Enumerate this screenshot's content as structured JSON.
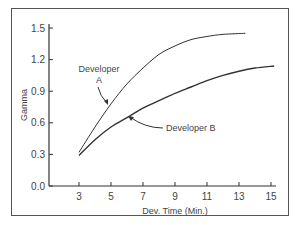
{
  "chart_data": {
    "type": "line",
    "title": "",
    "xlabel": "Dev. Time (Min.)",
    "ylabel": "Gamma",
    "xlim": [
      2,
      15.5
    ],
    "ylim": [
      0,
      1.6
    ],
    "x_ticks": [
      3,
      5,
      7,
      9,
      11,
      13,
      15
    ],
    "y_ticks": [
      "0.0",
      "0.3",
      "0.6",
      "0.9",
      "1.2",
      "1.5"
    ],
    "grid": false,
    "series": [
      {
        "name": "Developer A",
        "x": [
          3,
          4,
          5,
          6,
          7,
          8,
          9,
          10,
          11,
          12,
          13.4
        ],
        "y": [
          0.32,
          0.56,
          0.78,
          0.97,
          1.12,
          1.25,
          1.33,
          1.39,
          1.42,
          1.44,
          1.45
        ]
      },
      {
        "name": "Developer B",
        "x": [
          3,
          4,
          5,
          6,
          7,
          8,
          9,
          10,
          11,
          12,
          13,
          14,
          15.2
        ],
        "y": [
          0.29,
          0.44,
          0.56,
          0.65,
          0.74,
          0.81,
          0.88,
          0.94,
          1.0,
          1.05,
          1.09,
          1.12,
          1.14
        ]
      }
    ],
    "annotations": [
      {
        "text": "Developer A",
        "lines": [
          "Developer",
          "A"
        ]
      },
      {
        "text": "Developer B"
      }
    ]
  }
}
